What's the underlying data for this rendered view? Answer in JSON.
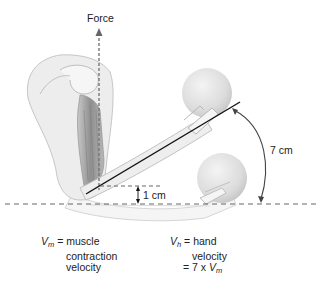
{
  "diagram": {
    "labels": {
      "force": "Force",
      "seven_cm": "7 cm",
      "one_cm": "1 cm"
    },
    "legend_left": {
      "symbol": "V",
      "subscript": "m",
      "equals": "=",
      "lines": [
        "muscle",
        "contraction",
        "velocity"
      ]
    },
    "legend_right": {
      "symbol": "V",
      "subscript": "h",
      "equals": "=",
      "lines": [
        "hand",
        "velocity"
      ],
      "formula_prefix": "= 7 x ",
      "formula_symbol": "V",
      "formula_subscript": "m"
    },
    "elements": [
      "upper-arm-and-shoulder",
      "biceps-muscle",
      "forearm-raised",
      "ball-raised",
      "forearm-lowered",
      "ball-lowered",
      "force-arrow",
      "lever-line",
      "baseline-dashed",
      "arc-arrow"
    ],
    "colors": {
      "line": "#111111",
      "dashed": "#555555",
      "body_fill": "#eeeeee",
      "body_stroke": "#bbbbbb",
      "muscle": "#9a9a9a",
      "ball": "#dddddd"
    }
  }
}
